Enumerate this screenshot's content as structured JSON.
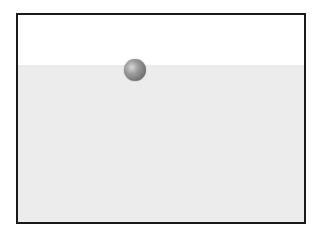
{
  "diagram": {
    "container": {
      "border_color": "#1a1a1a"
    },
    "regions": [
      {
        "name": "air",
        "color": "#ffffff"
      },
      {
        "name": "liquid",
        "color": "#ececec"
      }
    ],
    "objects": [
      {
        "name": "sphere",
        "color": "#7a7a7a",
        "position": "at liquid surface, partially submerged"
      }
    ]
  }
}
